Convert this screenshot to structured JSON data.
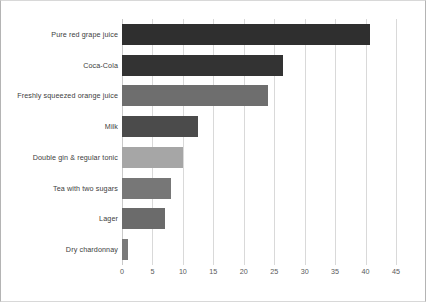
{
  "chart_data": {
    "type": "bar",
    "orientation": "horizontal",
    "title": "",
    "subtitle": "",
    "xlabel": "",
    "ylabel": "",
    "xlim": [
      0,
      45
    ],
    "xticks": [
      "0",
      "5",
      "10",
      "15",
      "20",
      "25",
      "30",
      "35",
      "40",
      "45"
    ],
    "xtick_values": [
      0,
      5,
      10,
      15,
      20,
      25,
      30,
      35,
      40,
      45
    ],
    "grid": true,
    "legend": false,
    "legend_position": "none",
    "categories": [
      "Pure red grape juice",
      "Coca-Cola",
      "Freshly squeezed orange juice",
      "Milk",
      "Double gin & regular tonic",
      "Tea with two sugars",
      "Lager",
      "Dry chardonnay"
    ],
    "values": [
      40.7,
      26.4,
      24.0,
      12.5,
      10.0,
      8.0,
      7.0,
      1.0
    ],
    "bar_colors": [
      "#2f2f2f",
      "#333333",
      "#6e6e6e",
      "#4b4b4b",
      "#a6a6a6",
      "#777777",
      "#6b6b6b",
      "#7a7a7a"
    ]
  },
  "colors": {
    "background": "#ffffff",
    "gridline": "#d9d9d9",
    "axis": "#c9c9c9",
    "tick_label": "#595959",
    "category_label": "#404040",
    "frame_border": "#b4b4b4"
  }
}
